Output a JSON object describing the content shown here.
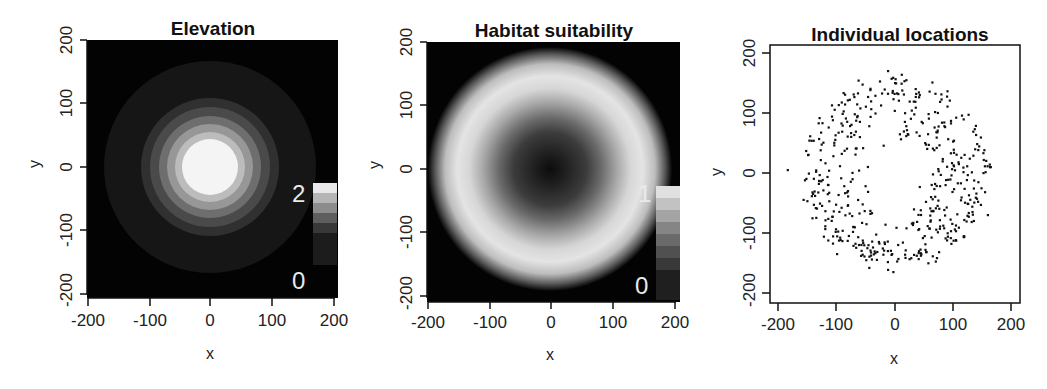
{
  "chart_data": [
    {
      "type": "heatmap",
      "title": "Elevation",
      "xlabel": "x",
      "ylabel": "y",
      "xlim": [
        -200,
        200
      ],
      "ylim": [
        -200,
        200
      ],
      "xticks": [
        "-200",
        "-100",
        "0",
        "100",
        "200"
      ],
      "yticks": [
        "-200",
        "-100",
        "0",
        "100",
        "200"
      ],
      "colormap": "grayscale",
      "legend": {
        "min_label": "0",
        "max_label": "2",
        "levels": 8
      },
      "description": "Radially symmetric peak centered at (0,0); value ~2 at center decreasing to 0 at radius ~150",
      "rings": [
        {
          "radius": 40,
          "color": "#f2f2f2"
        },
        {
          "radius": 60,
          "color": "#b8b8b8"
        },
        {
          "radius": 75,
          "color": "#8f8f8f"
        },
        {
          "radius": 90,
          "color": "#5e5e5e"
        },
        {
          "radius": 105,
          "color": "#3a3a3a"
        },
        {
          "radius": 145,
          "color": "#161616"
        }
      ]
    },
    {
      "type": "heatmap",
      "title": "Habitat suitability",
      "xlabel": "x",
      "ylabel": "y",
      "xlim": [
        -200,
        200
      ],
      "ylim": [
        -200,
        200
      ],
      "xticks": [
        "-200",
        "-100",
        "0",
        "100",
        "200"
      ],
      "yticks": [
        "-200",
        "-100",
        "0",
        "100",
        "200"
      ],
      "colormap": "grayscale",
      "legend": {
        "min_label": "0",
        "max_label": "1",
        "levels": 10
      },
      "description": "Ring-shaped suitability: low at center, maximum (~1) at radius ~120, falling to 0 beyond ~170"
    },
    {
      "type": "scatter",
      "title": "Individual locations",
      "xlabel": "x",
      "ylabel": "y",
      "xlim": [
        -210,
        210
      ],
      "ylim": [
        -210,
        210
      ],
      "xticks": [
        "-200",
        "-100",
        "0",
        "100",
        "200"
      ],
      "yticks": [
        "-200",
        "-100",
        "0",
        "100",
        "200"
      ],
      "n_points_approx": 500,
      "description": "Points distributed in an annulus roughly between radius 50 and 165 around (0,0), sparse center",
      "sample_points": [
        [
          -185,
          5
        ],
        [
          -12,
          170
        ],
        [
          -3,
          -165
        ],
        [
          165,
          10
        ],
        [
          160,
          -70
        ],
        [
          -150,
          30
        ],
        [
          110,
          15
        ],
        [
          -115,
          -20
        ],
        [
          0,
          150
        ],
        [
          -100,
          -135
        ]
      ]
    }
  ],
  "panels": {
    "p1": {
      "title": "Elevation",
      "xlabel": "x",
      "ylabel": "y",
      "leg_max": "2",
      "leg_min": "0"
    },
    "p2": {
      "title": "Habitat suitability",
      "xlabel": "x",
      "ylabel": "y",
      "leg_max": "1",
      "leg_min": "0"
    },
    "p3": {
      "title": "Individual locations",
      "xlabel": "x",
      "ylabel": "y"
    }
  },
  "ticks": {
    "t0": "-200",
    "t1": "-100",
    "t2": "0",
    "t3": "100",
    "t4": "200"
  }
}
